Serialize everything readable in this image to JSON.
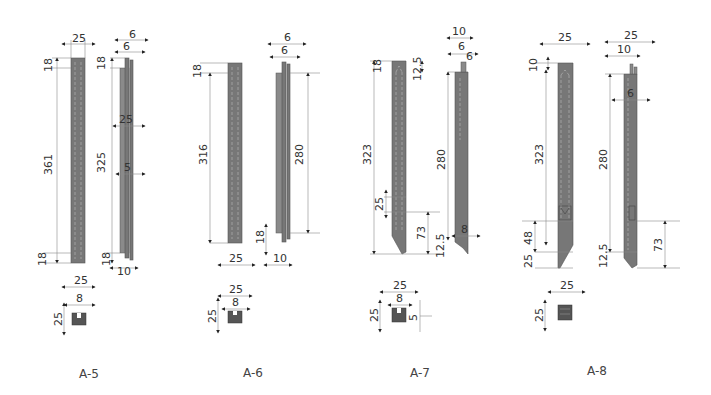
{
  "figure": {
    "parts": [
      {
        "id": "A-5",
        "caption": "A-5",
        "front_view": {
          "width": "25",
          "top": "18",
          "length": "361",
          "bottom": "18"
        },
        "side_view": {
          "top_w1": "6",
          "top_w2": "6",
          "top": "18",
          "length": "325",
          "mid_w": "25",
          "mid_w2": "5",
          "bottom": "18",
          "bottom_w": "10"
        },
        "section": {
          "width": "25",
          "slot": "8",
          "height": "25"
        }
      },
      {
        "id": "A-6",
        "caption": "A-6",
        "front_view": {
          "top": "18",
          "length": "316",
          "width": "25"
        },
        "side_view": {
          "top_w1": "6",
          "top_w2": "6",
          "length": "280",
          "bottom": "18",
          "bottom_w": "10"
        },
        "section": {
          "width": "25",
          "slot": "8",
          "height": "25"
        }
      },
      {
        "id": "A-7",
        "caption": "A-7",
        "front_view": {
          "top": "18",
          "top2": "12.5",
          "length": "323",
          "notch": "25",
          "tip": "73"
        },
        "side_view": {
          "top_w1": "10",
          "top_w2": "6",
          "top_w3": "6",
          "length": "280",
          "bottom_w": "8",
          "bottom": "12.5"
        },
        "section": {
          "width": "25",
          "slot": "8",
          "height": "25",
          "depth": "5"
        }
      },
      {
        "id": "A-8",
        "caption": "A-8",
        "front_view": {
          "width": "25",
          "top": "10",
          "length": "323",
          "notch": "48",
          "tip": "25"
        },
        "side_view": {
          "top_w1": "25",
          "top_w2": "10",
          "mid_w": "6",
          "length": "280",
          "bottom": "12.5",
          "tip": "73"
        },
        "section": {
          "width": "25",
          "height": "25"
        }
      }
    ]
  }
}
